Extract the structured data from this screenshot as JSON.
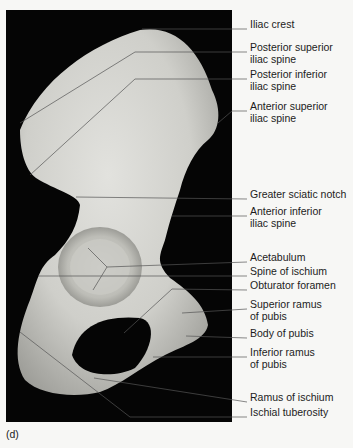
{
  "figure": {
    "panel_letter": "(d)",
    "labels": [
      {
        "text": "Iliac crest",
        "y": 24
      },
      {
        "text": "Posterior superior\niliac spine",
        "y": 47
      },
      {
        "text": "Posterior inferior\niliac spine",
        "y": 74
      },
      {
        "text": "Anterior superior\niliac spine",
        "y": 106
      },
      {
        "text": "Greater sciatic notch",
        "y": 194
      },
      {
        "text": "Anterior inferior\niliac spine",
        "y": 211
      },
      {
        "text": "Acetabulum",
        "y": 257
      },
      {
        "text": "Spine of ischium",
        "y": 271
      },
      {
        "text": "Obturator foramen",
        "y": 285
      },
      {
        "text": "Superior ramus\nof pubis",
        "y": 304
      },
      {
        "text": "Body of pubis",
        "y": 333
      },
      {
        "text": "Inferior ramus\nof pubis",
        "y": 352
      },
      {
        "text": "Ramus of ischium",
        "y": 397
      },
      {
        "text": "Ischial tuberosity",
        "y": 412
      }
    ]
  }
}
